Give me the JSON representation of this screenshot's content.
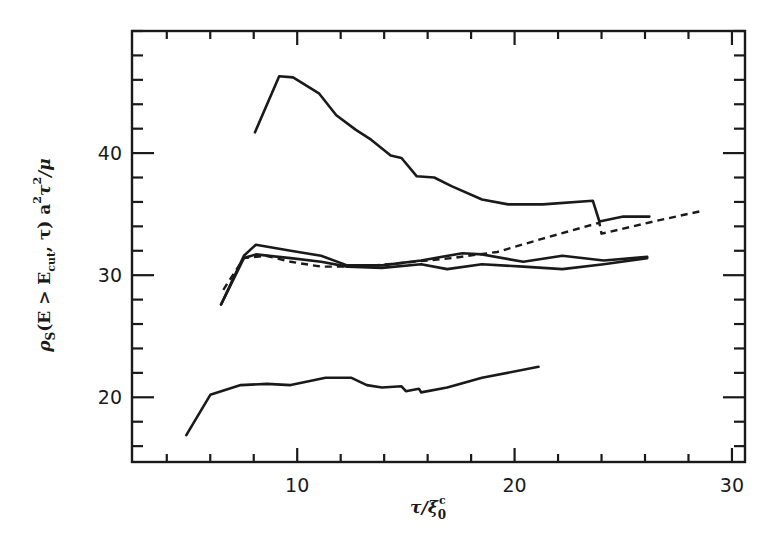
{
  "chart_data": {
    "type": "line",
    "title": "",
    "xlabel": "τ/ξ₀ᶜ",
    "ylabel": "ρS(E > Ecut, τ) a²τ²/μ",
    "xlim": [
      2.4,
      30.6
    ],
    "ylim": [
      14.7,
      50.0
    ],
    "x_major_ticks": [
      10,
      20,
      30
    ],
    "x_minor_step": 2,
    "y_major_ticks": [
      20,
      30,
      40
    ],
    "y_minor_step": 2,
    "grid": false,
    "legend": null,
    "series": [
      {
        "name": "curve-top",
        "style": "solid",
        "x": [
          8.06,
          9.17,
          9.81,
          11.0,
          11.8,
          12.7,
          13.4,
          14.3,
          14.8,
          15.5,
          16.3,
          17.1,
          18.5,
          19.7,
          21.3,
          23.6,
          23.9,
          25.0,
          26.2
        ],
        "y": [
          41.7,
          46.3,
          46.2,
          44.9,
          43.1,
          41.9,
          41.1,
          39.8,
          39.6,
          38.1,
          38.0,
          37.3,
          36.2,
          35.8,
          35.8,
          36.1,
          34.4,
          34.8,
          34.8
        ]
      },
      {
        "name": "curve-middle-upper",
        "style": "solid",
        "x": [
          6.5,
          7.55,
          8.1,
          9.7,
          11.1,
          12.3,
          13.9,
          15.7,
          17.6,
          18.5,
          20.4,
          22.2,
          24.1,
          26.1
        ],
        "y": [
          27.6,
          31.6,
          32.5,
          32.0,
          31.6,
          30.8,
          30.8,
          31.2,
          31.8,
          31.7,
          31.1,
          31.6,
          31.2,
          31.5
        ]
      },
      {
        "name": "curve-middle-lower",
        "style": "solid",
        "x": [
          6.5,
          7.55,
          8.1,
          9.7,
          11.1,
          12.3,
          13.9,
          15.7,
          16.9,
          18.5,
          20.4,
          22.2,
          24.1,
          26.1
        ],
        "y": [
          27.6,
          31.4,
          31.7,
          31.4,
          31.1,
          30.7,
          30.6,
          30.9,
          30.5,
          30.9,
          30.7,
          30.5,
          30.9,
          31.4
        ]
      },
      {
        "name": "curve-dashed",
        "style": "dashed",
        "x": [
          6.6,
          7.55,
          8.56,
          9.7,
          11.1,
          12.96,
          14.8,
          17.1,
          19.2,
          21.3,
          23.9,
          24.0,
          26.4,
          28.7
        ],
        "y": [
          28.8,
          31.4,
          31.6,
          31.1,
          30.7,
          30.7,
          31.0,
          31.4,
          31.9,
          33.0,
          34.3,
          33.4,
          34.4,
          35.3
        ]
      },
      {
        "name": "curve-bottom",
        "style": "solid",
        "x": [
          4.9,
          6.0,
          7.4,
          8.6,
          9.7,
          11.3,
          12.5,
          13.2,
          13.9,
          14.8,
          15.0,
          15.6,
          15.7,
          16.9,
          18.5,
          21.1
        ],
        "y": [
          16.9,
          20.2,
          21.0,
          21.1,
          21.0,
          21.6,
          21.6,
          21.0,
          20.8,
          20.9,
          20.5,
          20.7,
          20.4,
          20.8,
          21.6,
          22.5
        ]
      }
    ]
  },
  "labels": {
    "x_axis": {
      "main": "τ/ξ",
      "sub": "0",
      "sup": "c"
    },
    "y_axis": {
      "rho": "ρ",
      "rho_sub": "S",
      "mid": "(E > E",
      "cut_sub": "cut",
      "tail": ", τ)  a",
      "sq1": "2",
      "tau": "τ",
      "sq2": "2",
      "mu": "/μ"
    },
    "x_ticks": [
      "10",
      "20",
      "30"
    ],
    "y_ticks": [
      "20",
      "30",
      "40"
    ]
  }
}
